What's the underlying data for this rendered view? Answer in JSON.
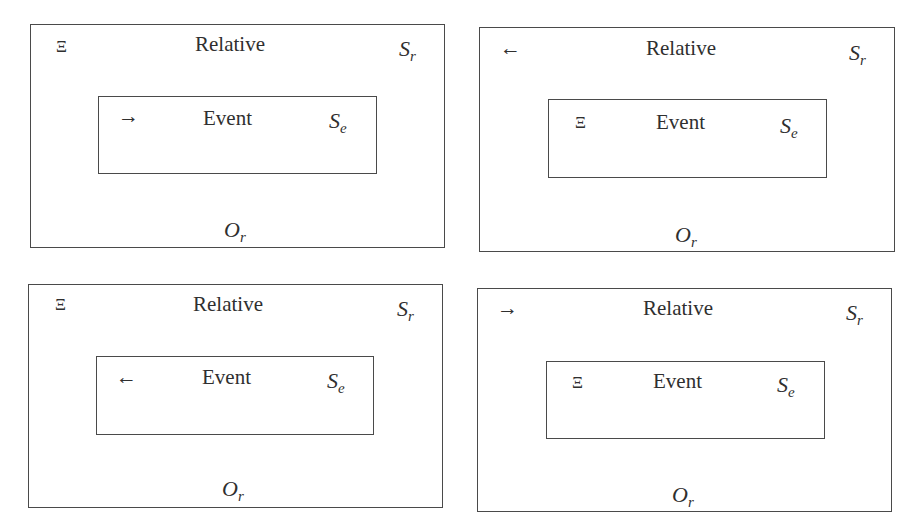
{
  "panels": [
    {
      "position": "top-left",
      "outer": {
        "title": "Relative",
        "corner_symbol": "Ξ",
        "corner_symbol_name": "xi-symbol",
        "frame_label_base": "S",
        "frame_label_sub": "r",
        "observer_base": "O",
        "observer_sub": "r"
      },
      "inner": {
        "title": "Event",
        "corner_symbol": "→",
        "corner_symbol_name": "arrow-right",
        "frame_label_base": "S",
        "frame_label_sub": "e"
      }
    },
    {
      "position": "top-right",
      "outer": {
        "title": "Relative",
        "corner_symbol": "←",
        "corner_symbol_name": "arrow-left",
        "frame_label_base": "S",
        "frame_label_sub": "r",
        "observer_base": "O",
        "observer_sub": "r"
      },
      "inner": {
        "title": "Event",
        "corner_symbol": "Ξ",
        "corner_symbol_name": "xi-symbol",
        "frame_label_base": "S",
        "frame_label_sub": "e"
      }
    },
    {
      "position": "bottom-left",
      "outer": {
        "title": "Relative",
        "corner_symbol": "Ξ",
        "corner_symbol_name": "xi-symbol",
        "frame_label_base": "S",
        "frame_label_sub": "r",
        "observer_base": "O",
        "observer_sub": "r"
      },
      "inner": {
        "title": "Event",
        "corner_symbol": "←",
        "corner_symbol_name": "arrow-left",
        "frame_label_base": "S",
        "frame_label_sub": "e"
      }
    },
    {
      "position": "bottom-right",
      "outer": {
        "title": "Relative",
        "corner_symbol": "→",
        "corner_symbol_name": "arrow-right",
        "frame_label_base": "S",
        "frame_label_sub": "r",
        "observer_base": "O",
        "observer_sub": "r"
      },
      "inner": {
        "title": "Event",
        "corner_symbol": "Ξ",
        "corner_symbol_name": "xi-symbol",
        "frame_label_base": "S",
        "frame_label_sub": "e"
      }
    }
  ],
  "colors": {
    "border": "#4a4a4a",
    "text": "#2f2f2f",
    "background": "#ffffff"
  }
}
